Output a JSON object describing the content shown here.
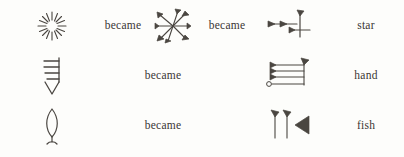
{
  "figure": {
    "title": "",
    "background_color": "#fdfdfb",
    "ink_color": "#4a4641",
    "became_label": "became",
    "columns": [
      "pictograph",
      "became",
      "early-cuneiform",
      "became",
      "late-cuneiform",
      "meaning"
    ]
  },
  "rows": [
    {
      "id": "star",
      "meaning": "star",
      "became_1": "became",
      "became_2": "became",
      "pictograph_name": "star-pictograph",
      "middle_name": "star-early-cuneiform",
      "cuneiform_name": "star-late-cuneiform",
      "has_middle": true
    },
    {
      "id": "hand",
      "meaning": "hand",
      "became_1": "became",
      "became_2": "",
      "pictograph_name": "hand-pictograph",
      "middle_name": "",
      "cuneiform_name": "hand-cuneiform",
      "has_middle": false
    },
    {
      "id": "fish",
      "meaning": "fish",
      "became_1": "became",
      "became_2": "",
      "pictograph_name": "fish-pictograph",
      "middle_name": "",
      "cuneiform_name": "fish-cuneiform",
      "has_middle": false
    }
  ]
}
